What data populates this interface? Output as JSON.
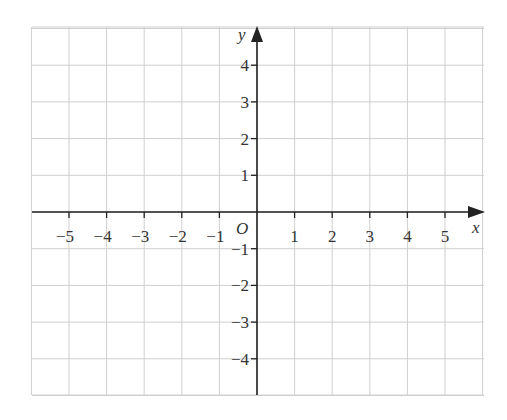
{
  "chart_data": {
    "type": "scatter",
    "title": "",
    "xlabel": "x",
    "ylabel": "y",
    "origin_label": "O",
    "xlim": [
      -6,
      6
    ],
    "ylim": [
      -5,
      5
    ],
    "grid": true,
    "x_ticks": [
      -5,
      -4,
      -3,
      -2,
      -1,
      1,
      2,
      3,
      4,
      5
    ],
    "y_ticks": [
      -4,
      -3,
      -2,
      -1,
      1,
      2,
      3,
      4
    ],
    "x_tick_labels": [
      "−5",
      "−4",
      "−3",
      "−2",
      "−1",
      "1",
      "2",
      "3",
      "4",
      "5"
    ],
    "y_tick_labels": [
      "−4",
      "−3",
      "−2",
      "−1",
      "1",
      "2",
      "3",
      "4"
    ],
    "series": [],
    "legend": null
  },
  "colors": {
    "grid": "#cfcfcf",
    "axis": "#222222",
    "text": "#333333",
    "background": "#ffffff"
  }
}
